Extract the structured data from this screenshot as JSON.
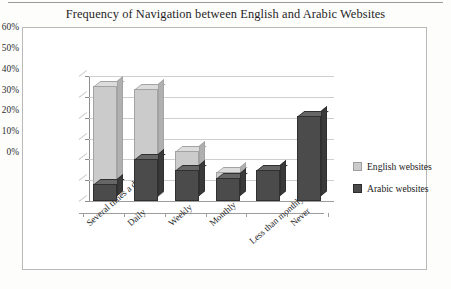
{
  "chart_data": {
    "type": "bar",
    "title": "Frequency of Navigation between English and Arabic Websites",
    "xlabel": "",
    "ylabel": "",
    "ylim": [
      0,
      60
    ],
    "ytick_labels": [
      "60%",
      "50%",
      "40%",
      "30%",
      "20%",
      "10%",
      "0%"
    ],
    "ytick_values": [
      60,
      50,
      40,
      30,
      20,
      10,
      0
    ],
    "grid": true,
    "legend_position": "right",
    "style": "3d-overlapping-columns",
    "categories": [
      "Several times a day",
      "Daily",
      "Weekly",
      "Monthly",
      "Less than monthly",
      "Never"
    ],
    "series": [
      {
        "name": "English websites",
        "color": "#cbcbcb",
        "values": [
          55,
          54,
          24,
          14,
          15,
          41
        ]
      },
      {
        "name": "Arabic websites",
        "color": "#4b4b4b",
        "values": [
          8,
          20,
          15,
          11,
          15,
          41
        ]
      }
    ]
  },
  "legend": {
    "items": [
      {
        "label": "English websites",
        "swatch": "eng"
      },
      {
        "label": "Arabic websites",
        "swatch": "ara"
      }
    ]
  }
}
